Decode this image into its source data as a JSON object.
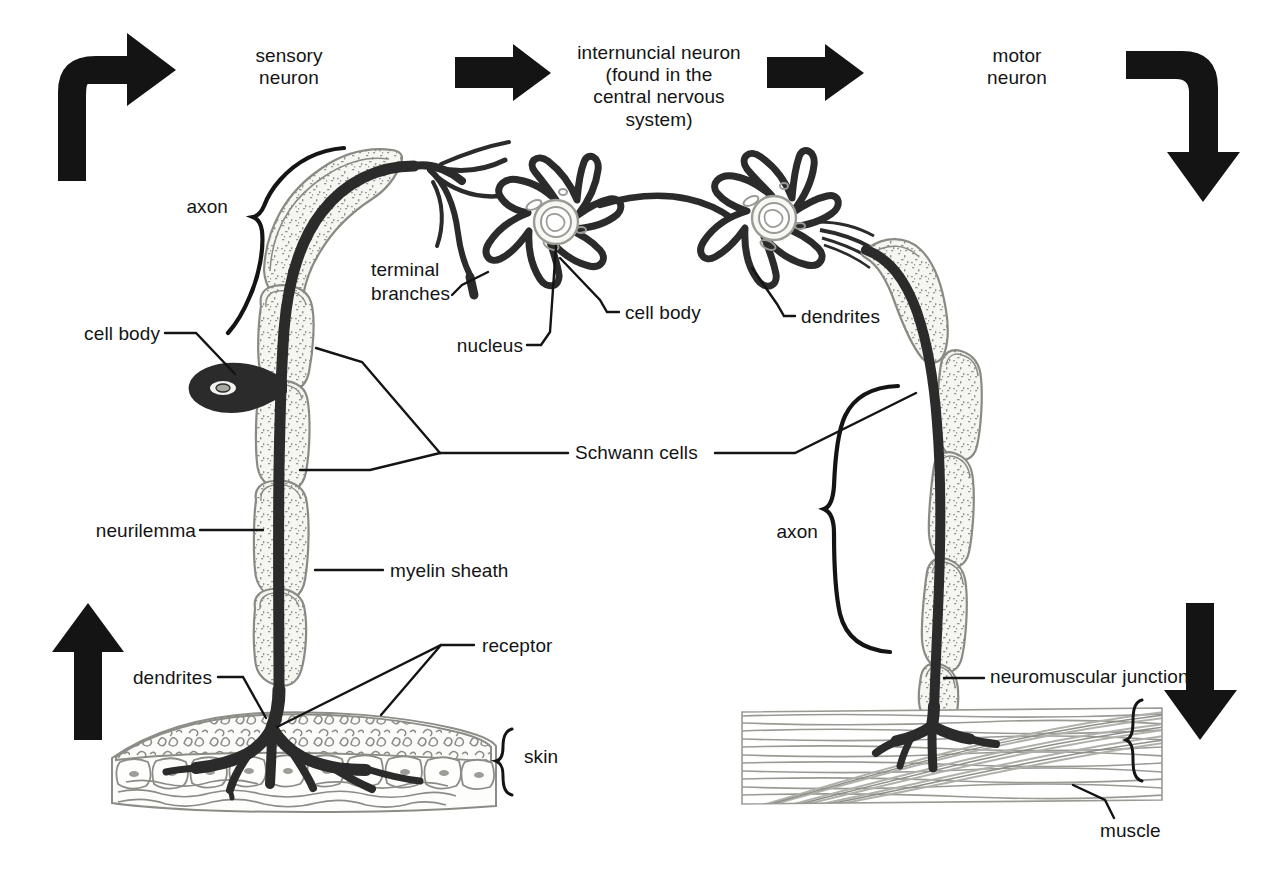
{
  "figure": {
    "ink": "#141414",
    "myelin_fill": "#f2f2ee",
    "myelin_stroke": "#8a8a85",
    "muscle_stroke": "#8c8c87"
  },
  "labels": {
    "sensory_neuron": "sensory\nneuron",
    "internuncial_neuron": "internuncial neuron\n(found in the\ncentral nervous\nsystem)",
    "motor_neuron": "motor\nneuron",
    "axon_left": "axon",
    "axon_right": "axon",
    "terminal_branches": "terminal\nbranches",
    "cell_body_sensory": "cell body",
    "cell_body_internuncial": "cell body",
    "nucleus": "nucleus",
    "dendrites_internuncial": "dendrites",
    "dendrites_sensory": "dendrites",
    "schwann_cells": "Schwann cells",
    "neurilemma": "neurilemma",
    "myelin_sheath": "myelin sheath",
    "receptor": "receptor",
    "skin": "skin",
    "neuromuscular_junction": "neuromuscular junction",
    "muscle": "muscle"
  },
  "flow_arrows": [
    {
      "name": "arrow-up-right-top-left",
      "direction": "up-then-right"
    },
    {
      "name": "arrow-right-into-internuncial",
      "direction": "right"
    },
    {
      "name": "arrow-right-out-of-internuncial",
      "direction": "right"
    },
    {
      "name": "arrow-right-then-down-top-right",
      "direction": "right-then-down"
    },
    {
      "name": "arrow-up-bottom-left",
      "direction": "up"
    },
    {
      "name": "arrow-down-bottom-right",
      "direction": "down"
    }
  ]
}
